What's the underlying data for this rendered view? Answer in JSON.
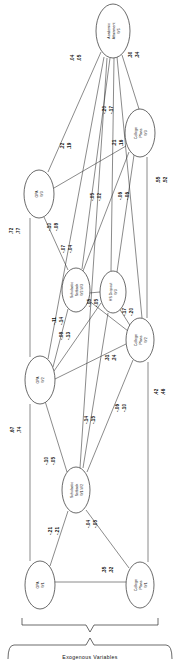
{
  "figure": {
    "type": "path-diagram",
    "orientation": "rotated-90-ccw",
    "bracket_label": "Exogenous Variables"
  },
  "nodes": [
    {
      "id": "aa_w5",
      "label_line1": "Academic",
      "label_line2": "Attainment",
      "label_line3": "W5",
      "cx": 113,
      "cy": 31,
      "rx": 17,
      "ry": 27
    },
    {
      "id": "cp_w3",
      "label_line1": "College",
      "label_line2": "Plans",
      "label_line3": "W3",
      "cx": 140,
      "cy": 133,
      "rx": 15,
      "ry": 24
    },
    {
      "id": "gpa_w3",
      "label_line1": "GPA",
      "label_line2": "W3",
      "label_line3": "",
      "cx": 39,
      "cy": 194,
      "rx": 15,
      "ry": 24
    },
    {
      "id": "ss_w2w3",
      "label_line1": "Scholastic",
      "label_line2": "Setback",
      "label_line3": "W2-W3",
      "cx": 76,
      "cy": 290,
      "rx": 14,
      "ry": 22
    },
    {
      "id": "hs_w3",
      "label_line1": "HS Dropout",
      "label_line2": "W3",
      "label_line3": "",
      "cx": 113,
      "cy": 292,
      "rx": 13,
      "ry": 21
    },
    {
      "id": "cp_w2",
      "label_line1": "College",
      "label_line2": "Plans",
      "label_line3": "W2",
      "cx": 140,
      "cy": 340,
      "rx": 14,
      "ry": 22
    },
    {
      "id": "gpa_w2",
      "label_line1": "GPA",
      "label_line2": "W2",
      "label_line3": "",
      "cx": 40,
      "cy": 380,
      "rx": 15,
      "ry": 24
    },
    {
      "id": "ss_w1w2",
      "label_line1": "Scholastic",
      "label_line2": "Setback",
      "label_line3": "W1-W2",
      "cx": 76,
      "cy": 490,
      "rx": 14,
      "ry": 23
    },
    {
      "id": "gpa_w1",
      "label_line1": "GPA",
      "label_line2": "W1",
      "label_line3": "",
      "cx": 40,
      "cy": 585,
      "rx": 15,
      "ry": 24
    },
    {
      "id": "cp_w1",
      "label_line1": "College",
      "label_line2": "Plans",
      "label_line3": "W1",
      "cx": 140,
      "cy": 585,
      "rx": 14,
      "ry": 23
    }
  ],
  "edges": [
    {
      "id": "e1",
      "from": "gpa_w3",
      "to": "aa_w5",
      "v1": ".22",
      "v2": ".19",
      "lx": 63,
      "ly": 146
    },
    {
      "id": "e2",
      "from": "cp_w3",
      "to": "aa_w5",
      "v1": ".30",
      "v2": ".34",
      "lx": 131,
      "ly": 55
    },
    {
      "id": "e3",
      "from": "ss_w2w3",
      "to": "aa_w5",
      "v1": ".04",
      "v2": ".05",
      "lx": 73,
      "ly": 58
    },
    {
      "id": "e4",
      "from": "hs_w3",
      "to": "aa_w5",
      "v1": "-.20",
      "v2": "-.17",
      "lx": 105,
      "ly": 110
    },
    {
      "id": "e5",
      "from": "gpa_w3",
      "to": "cp_w3",
      "v1": ".21",
      "v2": ".16",
      "lx": 115,
      "ly": 143
    },
    {
      "id": "e6",
      "from": "cp_w2",
      "to": "cp_w3",
      "v1": ".55",
      "v2": ".52",
      "lx": 159,
      "ly": 180
    },
    {
      "id": "e7",
      "from": "gpa_w2",
      "to": "gpa_w3",
      "v1": ".72",
      "v2": ".77",
      "lx": 15,
      "ly": 231
    },
    {
      "id": "e8",
      "from": "ss_w2w3",
      "to": "gpa_w3",
      "v1": "-.10",
      "v2": "-.08",
      "lx": 54,
      "ly": 227
    },
    {
      "id": "e9",
      "from": "ss_w2w3",
      "to": "cp_w3",
      "v1": "-.07",
      "v2": "-.04",
      "lx": 67,
      "ly": 249
    },
    {
      "id": "e10",
      "from": "ss_w2w3",
      "to": "hs_w3",
      "v1": "-.05",
      "v2": "-.02",
      "lx": 96,
      "ly": 197
    },
    {
      "id": "e11",
      "from": "hs_w3",
      "to": "cp_w3",
      "v1": "-.06",
      "v2": "-.06",
      "lx": 124,
      "ly": 196
    },
    {
      "id": "e12",
      "from": "gpa_w2",
      "to": "ss_w2w3",
      "v1": "-.11",
      "v2": "-.14",
      "lx": 57,
      "ly": 321
    },
    {
      "id": "e13",
      "from": "gpa_w2",
      "to": "hs_w3",
      "v1": "-.08",
      "v2": "-.13",
      "lx": 66,
      "ly": 334
    },
    {
      "id": "e14",
      "from": "ss_w2w3",
      "to": "cp_w2",
      "v1": "-.05",
      "v2": "-.05",
      "lx": 92,
      "ly": 303
    },
    {
      "id": "e15",
      "from": "cp_w2",
      "to": "hs_w3",
      "v1": "-.17",
      "v2": "-.20",
      "lx": 128,
      "ly": 312
    },
    {
      "id": "e16",
      "from": "gpa_w2",
      "to": "cp_w2",
      "v1": ".31",
      "v2": ".24",
      "lx": 111,
      "ly": 358
    },
    {
      "id": "e17",
      "from": "ss_w1w2",
      "to": "gpa_w2",
      "v1": "-.10",
      "v2": "-.05",
      "lx": 50,
      "ly": 461
    },
    {
      "id": "e18",
      "from": "ss_w1w2",
      "to": "hs_w3",
      "v1": "-.14",
      "v2": "-.15",
      "lx": 90,
      "ly": 420
    },
    {
      "id": "e19",
      "from": "ss_w1w2",
      "to": "cp_w2",
      "v1": "-.06",
      "v2": "-.10",
      "lx": 121,
      "ly": 408
    },
    {
      "id": "e20",
      "from": "gpa_w1",
      "to": "gpa_w2",
      "v1": ".67",
      "v2": ".74",
      "lx": 16,
      "ly": 430
    },
    {
      "id": "e21",
      "from": "cp_w1",
      "to": "cp_w2",
      "v1": ".42",
      "v2": ".46",
      "lx": 157,
      "ly": 392
    },
    {
      "id": "e22",
      "from": "gpa_w1",
      "to": "ss_w1w2",
      "v1": "-.21",
      "v2": "-.21",
      "lx": 54,
      "ly": 531
    },
    {
      "id": "e23",
      "from": "cp_w1",
      "to": "ss_w1w2",
      "v1": "-.04",
      "v2": "-.05",
      "lx": 92,
      "ly": 524
    },
    {
      "id": "e24",
      "from": "gpa_w1",
      "to": "cp_w1",
      "v1": ".35",
      "v2": ".32",
      "lx": 108,
      "ly": 570
    }
  ]
}
